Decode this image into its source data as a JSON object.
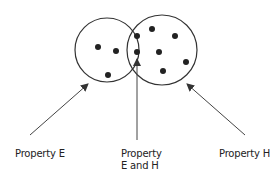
{
  "diagram": {
    "type": "venn",
    "sets": [
      {
        "id": "E",
        "cx": 107,
        "cy": 50,
        "r": 32
      },
      {
        "id": "H",
        "cx": 162,
        "cy": 50,
        "r": 35
      }
    ],
    "dots": {
      "only_e": [
        [
          98,
          47
        ],
        [
          116,
          51
        ],
        [
          108,
          75
        ]
      ],
      "both": [
        [
          137,
          36
        ],
        [
          137,
          52
        ]
      ],
      "only_h": [
        [
          152,
          29
        ],
        [
          175,
          36
        ],
        [
          159,
          52
        ],
        [
          186,
          62
        ],
        [
          163,
          71
        ]
      ]
    },
    "colors": {
      "stroke": "#333333",
      "dot": "#222222",
      "text": "#222222"
    }
  },
  "labels": {
    "property_e": "Property E",
    "property_eh_line1": "Property",
    "property_eh_line2": "E and H",
    "property_h": "Property H"
  }
}
